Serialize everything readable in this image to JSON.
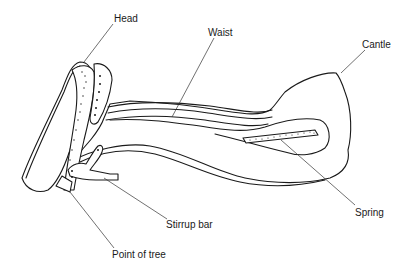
{
  "diagram": {
    "labels": {
      "head": "Head",
      "waist": "Waist",
      "cantle": "Cantle",
      "spring": "Spring",
      "stirrup_bar": "Stirrup bar",
      "point_of_tree": "Point of tree"
    },
    "colors": {
      "line": "#1a1a1a",
      "background": "#ffffff"
    }
  }
}
